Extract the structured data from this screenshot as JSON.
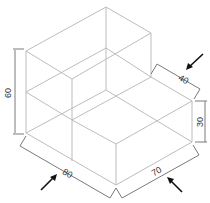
{
  "diagram": {
    "type": "isometric-technical-drawing",
    "colors": {
      "edges": "#b4b4b4",
      "dimension_lines": "#7a7a7a",
      "pointer_arrows": "#111111",
      "text": "#333333"
    },
    "dimensions": [
      {
        "id": "height-total",
        "label": "60"
      },
      {
        "id": "length-front-left",
        "label": "80"
      },
      {
        "id": "length-front-right",
        "label": "70"
      },
      {
        "id": "step-depth",
        "label": "40"
      },
      {
        "id": "step-height",
        "label": "30"
      }
    ],
    "arrows": [
      {
        "id": "arrow-top-right",
        "points_to": "40"
      },
      {
        "id": "arrow-bottom-left",
        "points_to": "80"
      },
      {
        "id": "arrow-bottom-right",
        "points_to": "70"
      }
    ]
  }
}
